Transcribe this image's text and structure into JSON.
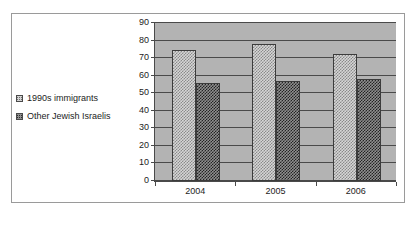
{
  "chart_data": {
    "type": "bar",
    "title": "",
    "xlabel": "",
    "ylabel": "",
    "categories": [
      "2004",
      "2005",
      "2006"
    ],
    "series": [
      {
        "name": "1990s immigrants",
        "values": [
          74.5,
          78,
          72.5
        ]
      },
      {
        "name": "Other Jewish Israelis",
        "values": [
          56,
          57,
          58
        ]
      }
    ],
    "ylim": [
      0,
      90
    ],
    "ytick_labels": [
      "90",
      "80",
      "70",
      "60",
      "50",
      "40",
      "30",
      "20",
      "10",
      "0"
    ],
    "ytick_values": [
      90,
      80,
      70,
      60,
      50,
      40,
      30,
      20,
      10,
      0
    ],
    "ytick_step": 10,
    "grid": true,
    "legend_position": "left-outside",
    "plot_background": "#b3b3b3",
    "axis_color": "#4a4a4a",
    "series_colors": [
      "#d6d6d6",
      "#8f8f8f"
    ]
  },
  "legend": {
    "items": [
      {
        "label": "1990s immigrants",
        "swatch": "light-checker-swatch"
      },
      {
        "label": "Other Jewish Israelis",
        "swatch": "dark-checker-swatch"
      }
    ]
  }
}
